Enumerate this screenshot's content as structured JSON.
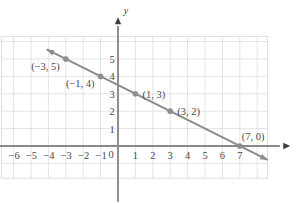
{
  "chart_data": {
    "type": "line",
    "title": "",
    "xlabel": "x",
    "ylabel": "y",
    "xlim": [
      -6.8,
      8.8
    ],
    "ylim": [
      -1.9,
      6.6
    ],
    "grid": true,
    "legend": "none",
    "line": {
      "name": "x + 2y = 7",
      "from": {
        "x": -4.1,
        "y": 5.55
      },
      "to": {
        "x": 8.6,
        "y": -0.8
      },
      "slope": -0.5,
      "y_intercept": 3.5,
      "style": "solid",
      "arrow_start": true,
      "arrow_end": true,
      "color": "#8c8c8c"
    },
    "points": [
      {
        "x": -3,
        "y": 5,
        "label": "(−3, 5)",
        "label_pos": "left-below"
      },
      {
        "x": -1,
        "y": 4,
        "label": "(−1, 4)",
        "label_pos": "left-below"
      },
      {
        "x": 1,
        "y": 3,
        "label": "(1, 3)",
        "label_pos": "right"
      },
      {
        "x": 3,
        "y": 2,
        "label": "(3, 2)",
        "label_pos": "right"
      },
      {
        "x": 7,
        "y": 0,
        "label": "(7, 0)",
        "label_pos": "right-above"
      }
    ],
    "x_ticks": [
      {
        "value": -6,
        "label": "−6"
      },
      {
        "value": -5,
        "label": "−5"
      },
      {
        "value": -4,
        "label": "−4"
      },
      {
        "value": -3,
        "label": "−3"
      },
      {
        "value": -2,
        "label": "−2"
      },
      {
        "value": -1,
        "label": "−1"
      },
      {
        "value": 1,
        "label": "1"
      },
      {
        "value": 2,
        "label": "2"
      },
      {
        "value": 3,
        "label": "3"
      },
      {
        "value": 4,
        "label": "4"
      },
      {
        "value": 5,
        "label": "5"
      },
      {
        "value": 6,
        "label": "6"
      },
      {
        "value": 7,
        "label": "7"
      }
    ],
    "y_ticks": [
      {
        "value": 1,
        "label": "1"
      },
      {
        "value": 2,
        "label": "2"
      },
      {
        "value": 3,
        "label": "3"
      },
      {
        "value": 4,
        "label": "4"
      },
      {
        "value": 5,
        "label": "5"
      }
    ],
    "origin_label": "0",
    "colors": {
      "line": "#8c8c8c",
      "point": "#8e8e8e",
      "axis": "#8a8a8a",
      "grid": "#d8d8d8",
      "text": "#4a4a4a",
      "background": "#ffffff"
    }
  },
  "axis_labels": {
    "x": "x",
    "y": "y"
  }
}
